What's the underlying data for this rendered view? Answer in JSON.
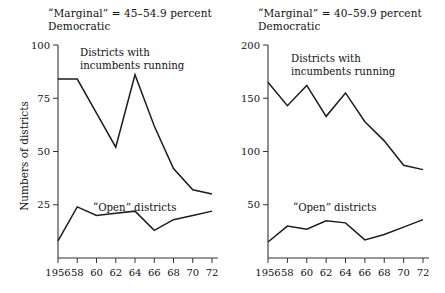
{
  "figure": {
    "ylabel": "Numbers of districts"
  },
  "panels": [
    {
      "id": "left",
      "title": "“Marginal” = 45–54.9 percent\nDemocratic",
      "annotations": {
        "incumbents": "Districts with\nincumbents running",
        "open": "“Open” districts"
      },
      "chart_data": {
        "type": "line",
        "title": "“Marginal” = 45–54.9 percent Democratic",
        "xlabel": "",
        "ylabel": "Numbers of districts",
        "x": [
          1956,
          1958,
          1960,
          1962,
          1964,
          1966,
          1968,
          1970,
          1972
        ],
        "xtick_labels": [
          "1956",
          "58",
          "60",
          "62",
          "64",
          "66",
          "68",
          "70",
          "72"
        ],
        "ytick_labels": [
          "25",
          "50",
          "75",
          "100"
        ],
        "yticks": [
          25,
          50,
          75,
          100
        ],
        "ylim": [
          0,
          100
        ],
        "xlim": [
          1956,
          1972
        ],
        "grid": false,
        "legend": "inline-annotation",
        "series": [
          {
            "name": "Districts with incumbents running",
            "values": [
              84,
              84,
              68,
              52,
              86,
              62,
              42,
              32,
              30
            ]
          },
          {
            "name": "“Open” districts",
            "values": [
              8,
              24,
              20,
              21,
              22,
              13,
              18,
              20,
              22
            ]
          }
        ]
      }
    },
    {
      "id": "right",
      "title": "“Marginal” = 40–59.9 percent\nDemocratic",
      "annotations": {
        "incumbents": "Districts with\nincumbents running",
        "open": "“Open” districts"
      },
      "chart_data": {
        "type": "line",
        "title": "“Marginal” = 40–59.9 percent Democratic",
        "xlabel": "",
        "ylabel": "",
        "x": [
          1956,
          1958,
          1960,
          1962,
          1964,
          1966,
          1968,
          1970,
          1972
        ],
        "xtick_labels": [
          "1956",
          "58",
          "60",
          "62",
          "64",
          "66",
          "68",
          "70",
          "72"
        ],
        "ytick_labels": [
          "50",
          "100",
          "150",
          "200"
        ],
        "yticks": [
          50,
          100,
          150,
          200
        ],
        "ylim": [
          0,
          200
        ],
        "xlim": [
          1956,
          1972
        ],
        "grid": false,
        "legend": "inline-annotation",
        "series": [
          {
            "name": "Districts with incumbents running",
            "values": [
              165,
              143,
              162,
              133,
              155,
              128,
              110,
              87,
              83
            ]
          },
          {
            "name": "“Open” districts",
            "values": [
              15,
              30,
              27,
              35,
              33,
              17,
              22,
              29,
              36
            ]
          }
        ]
      }
    }
  ],
  "colors": {
    "line": "#1c1c1c",
    "axis": "#333333",
    "text": "#111111",
    "background": "#ffffff"
  }
}
